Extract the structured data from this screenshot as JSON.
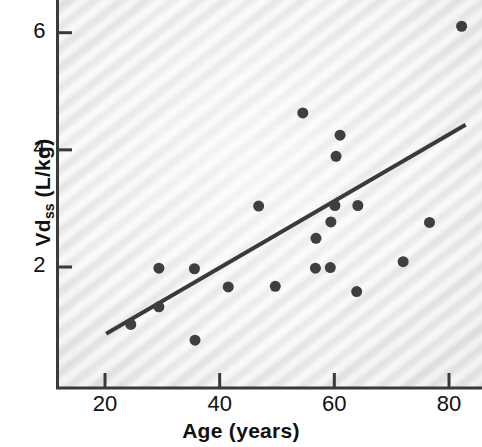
{
  "chart_data": {
    "type": "scatter",
    "title": "",
    "xlabel": "Age (years)",
    "ylabel": "Vdss (L/kg)",
    "ylabel_base": "Vd",
    "ylabel_sub": "ss",
    "ylabel_unit": " (L/kg)",
    "xlim": [
      5.2,
      88.0
    ],
    "ylim": [
      -0.78,
      6.31
    ],
    "grid": false,
    "legend": null,
    "xticks": [
      20,
      40,
      60,
      80
    ],
    "xtick_labels": [
      "20",
      "40",
      "60",
      "80"
    ],
    "yticks": [
      2,
      4,
      6
    ],
    "ytick_labels": [
      "2",
      "4",
      "6"
    ],
    "marker": "filled-circle",
    "marker_color": "#3f3f3f",
    "marker_size_px": 11,
    "points": [
      {
        "x": 24.5,
        "y": 1.02
      },
      {
        "x": 29.4,
        "y": 1.32
      },
      {
        "x": 29.4,
        "y": 1.98
      },
      {
        "x": 35.6,
        "y": 1.97
      },
      {
        "x": 35.7,
        "y": 0.75
      },
      {
        "x": 41.5,
        "y": 1.66
      },
      {
        "x": 46.8,
        "y": 3.04
      },
      {
        "x": 49.7,
        "y": 1.67
      },
      {
        "x": 54.5,
        "y": 4.63
      },
      {
        "x": 56.7,
        "y": 1.98
      },
      {
        "x": 56.8,
        "y": 2.49
      },
      {
        "x": 59.3,
        "y": 1.99
      },
      {
        "x": 59.4,
        "y": 2.77
      },
      {
        "x": 60.1,
        "y": 3.05
      },
      {
        "x": 60.3,
        "y": 3.89
      },
      {
        "x": 61.0,
        "y": 4.25
      },
      {
        "x": 63.9,
        "y": 1.58
      },
      {
        "x": 64.1,
        "y": 3.05
      },
      {
        "x": 72.0,
        "y": 2.09
      },
      {
        "x": 76.6,
        "y": 2.76
      },
      {
        "x": 82.2,
        "y": 6.11
      }
    ],
    "regression_line": {
      "x_start": 20.2,
      "y_start": 0.86,
      "x_end": 82.9,
      "y_end": 4.43,
      "color": "#3a3a3a",
      "width_px": 4
    },
    "axis_color": "#3a3a3a",
    "background_color": "#f4f4f4"
  }
}
